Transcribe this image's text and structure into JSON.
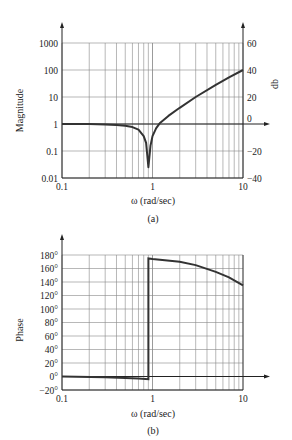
{
  "chart_data": [
    {
      "type": "line",
      "panel_label": "(a)",
      "title": "",
      "xlabel": "ω (rad/sec)",
      "ylabel": "Magnitude",
      "ylabel_right": "db",
      "xscale": "log",
      "yscale": "log",
      "xlim": [
        0.1,
        10
      ],
      "ylim": [
        0.01,
        1000
      ],
      "ylim_right": [
        -40,
        60
      ],
      "x_ticks": [
        "0.1",
        "1",
        "10"
      ],
      "y_ticks": [
        "0.01",
        "0.1",
        "1",
        "10",
        "100",
        "1000"
      ],
      "y_ticks_right": [
        "−40",
        "−20",
        "0",
        "20",
        "40",
        "60"
      ],
      "grid": true,
      "series": [
        {
          "name": "magnitude",
          "x": [
            0.1,
            0.2,
            0.3,
            0.4,
            0.5,
            0.6,
            0.7,
            0.8,
            0.85,
            0.9,
            0.95,
            1.0,
            1.1,
            1.2,
            1.5,
            2,
            3,
            5,
            7,
            10
          ],
          "y_db": [
            0,
            -0.1,
            -0.3,
            -0.7,
            -1.3,
            -2.3,
            -4.2,
            -9,
            -14,
            -32,
            -16,
            -9,
            -3,
            0.5,
            6,
            12,
            20,
            29,
            34.5,
            40
          ]
        }
      ]
    },
    {
      "type": "line",
      "panel_label": "(b)",
      "title": "",
      "xlabel": "ω (rad/sec)",
      "ylabel": "Phase",
      "xscale": "log",
      "xlim": [
        0.1,
        10
      ],
      "ylim": [
        -20,
        180
      ],
      "x_ticks": [
        "0.1",
        "1",
        "10"
      ],
      "y_ticks": [
        "−20°",
        "0°",
        "20°",
        "40°",
        "60°",
        "80°",
        "100°",
        "120°",
        "140°",
        "160°",
        "180°"
      ],
      "grid": true,
      "series": [
        {
          "name": "phase",
          "x": [
            0.1,
            0.3,
            0.5,
            0.7,
            0.9,
            0.9,
            1.0,
            2,
            3,
            5,
            7,
            10
          ],
          "y": [
            0,
            -1,
            -2,
            -3,
            -4,
            175,
            174,
            170,
            165,
            155,
            147,
            135
          ]
        }
      ]
    }
  ]
}
